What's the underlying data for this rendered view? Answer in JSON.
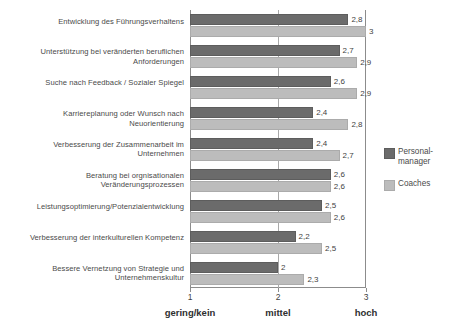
{
  "chart_data": {
    "type": "bar",
    "orientation": "horizontal",
    "title": "",
    "subtitle": "",
    "xlabel": "",
    "ylabel": "",
    "xlim": [
      1,
      3
    ],
    "grid": true,
    "gridlines_x": [
      2
    ],
    "legend_position": "right",
    "x_ticks": [
      {
        "value": 1,
        "label": "1",
        "caption": "gering/kein"
      },
      {
        "value": 2,
        "label": "2",
        "caption": "mittel"
      },
      {
        "value": 3,
        "label": "3",
        "caption": "hoch"
      }
    ],
    "categories": [
      "Entwicklung des Führungsverhaltens",
      "Unterstützung bei veränderten beruflichen Anforderungen",
      "Suche nach Feedback / Sozialer Spiegel",
      "Karriereplanung oder Wunsch nach Neuorientierung",
      "Verbesserung der Zusammenarbeit im Unternehmen",
      "Beratung bei orgnisationalen Veränderungsprozessen",
      "Leistungsoptimierung/Potenzialentwicklung",
      "Verbesserung der interkulturellen Kompetenz",
      "Bessere Vernetzung von Strategie und Unternehmenskultur"
    ],
    "series": [
      {
        "name": "Personal-manager",
        "color": "#6b6b6b",
        "values": [
          2.8,
          2.7,
          2.6,
          2.4,
          2.4,
          2.6,
          2.5,
          2.2,
          2
        ],
        "value_labels": [
          "2,8",
          "2,7",
          "2,6",
          "2,4",
          "2,4",
          "2,6",
          "2,5",
          "2,2",
          "2"
        ]
      },
      {
        "name": "Coaches",
        "color": "#bcbcbc",
        "values": [
          3,
          2.9,
          2.9,
          2.8,
          2.7,
          2.6,
          2.6,
          2.5,
          2.3
        ],
        "value_labels": [
          "3",
          "2,9",
          "2,9",
          "2,8",
          "2,7",
          "2,6",
          "2,6",
          "2,5",
          "2,3"
        ]
      }
    ]
  },
  "legend": {
    "items": [
      {
        "label": "Personal-\nmanager",
        "swatch": "s0"
      },
      {
        "label": "Coaches",
        "swatch": "s1"
      }
    ]
  }
}
